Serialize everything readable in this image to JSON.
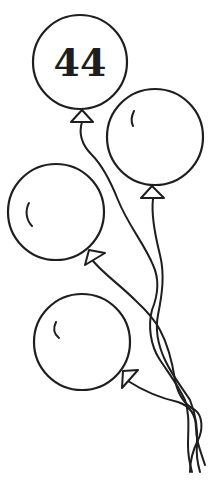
{
  "illustration": {
    "subject": "bunch of four balloons with tangled strings",
    "balloons": [
      {
        "id": "balloon-1",
        "label": "44"
      },
      {
        "id": "balloon-2",
        "label": ""
      },
      {
        "id": "balloon-3",
        "label": ""
      },
      {
        "id": "balloon-4",
        "label": ""
      }
    ],
    "colors": {
      "ink": "#1e1e1e",
      "background": "#ffffff"
    }
  }
}
